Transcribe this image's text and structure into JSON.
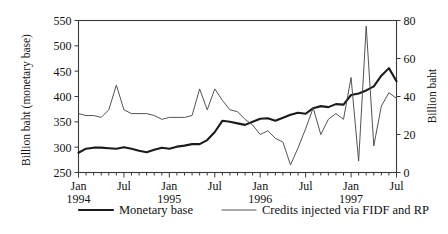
{
  "chart_data": {
    "type": "line",
    "title": "",
    "xlabel": "",
    "ylabel": "Billion baht (monetary base)",
    "ylabel_right": "Billion baht",
    "ylim": [
      250,
      550
    ],
    "ylim_right": [
      0,
      80
    ],
    "yticks": [
      250,
      300,
      350,
      400,
      450,
      500,
      550
    ],
    "yticks_right": [
      0,
      20,
      40,
      60,
      80
    ],
    "grid": false,
    "legend_position": "below",
    "x": [
      "Jan 1994",
      "Feb 1994",
      "Mar 1994",
      "Apr 1994",
      "May 1994",
      "Jun 1994",
      "Jul 1994",
      "Aug 1994",
      "Sep 1994",
      "Oct 1994",
      "Nov 1994",
      "Dec 1994",
      "Jan 1995",
      "Feb 1995",
      "Mar 1995",
      "Apr 1995",
      "May 1995",
      "Jun 1995",
      "Jul 1995",
      "Aug 1995",
      "Sep 1995",
      "Oct 1995",
      "Nov 1995",
      "Dec 1995",
      "Jan 1996",
      "Feb 1996",
      "Mar 1996",
      "Apr 1996",
      "May 1996",
      "Jun 1996",
      "Jul 1996",
      "Aug 1996",
      "Sep 1996",
      "Oct 1996",
      "Nov 1996",
      "Dec 1996",
      "Jan 1997",
      "Feb 1997",
      "Mar 1997",
      "Apr 1997",
      "May 1997",
      "Jun 1997",
      "Jul 1997"
    ],
    "xtick_labels": [
      {
        "index": 0,
        "line1": "Jan",
        "line2": "1994"
      },
      {
        "index": 6,
        "line1": "Jul",
        "line2": ""
      },
      {
        "index": 12,
        "line1": "Jan",
        "line2": "1995"
      },
      {
        "index": 18,
        "line1": "Jul",
        "line2": ""
      },
      {
        "index": 24,
        "line1": "Jan",
        "line2": "1996"
      },
      {
        "index": 30,
        "line1": "Jul",
        "line2": ""
      },
      {
        "index": 36,
        "line1": "Jan",
        "line2": "1997"
      },
      {
        "index": 42,
        "line1": "Jul",
        "line2": ""
      }
    ],
    "series": [
      {
        "name": "Monetary base",
        "axis": "left",
        "style": "thick",
        "color": "#1b1b1b",
        "values": [
          289,
          297,
          299,
          299,
          298,
          297,
          300,
          297,
          293,
          290,
          295,
          299,
          297,
          301,
          303,
          306,
          306,
          314,
          330,
          352,
          350,
          347,
          344,
          350,
          356,
          357,
          352,
          358,
          364,
          368,
          366,
          377,
          381,
          379,
          385,
          384,
          403,
          406,
          412,
          420,
          441,
          456,
          430
        ]
      },
      {
        "name": "Credits injected via FIDF and RP",
        "axis": "right",
        "style": "thin",
        "color": "#4a4a4a",
        "values": [
          31,
          30,
          30,
          29,
          33,
          46,
          33,
          31,
          31,
          31,
          30,
          28,
          29,
          29,
          29,
          30,
          44,
          33,
          44,
          38,
          33,
          32,
          28,
          25,
          20,
          22,
          18,
          16,
          4,
          13,
          23,
          34,
          20,
          28,
          31,
          28,
          50,
          6,
          77,
          14,
          35,
          42,
          39
        ]
      }
    ],
    "legend": [
      {
        "label": "Monetary base",
        "style": "thick"
      },
      {
        "label": "Credits injected via FIDF and RP",
        "style": "thin"
      }
    ]
  }
}
